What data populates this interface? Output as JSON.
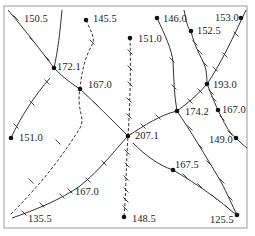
{
  "diagram": {
    "type": "topographic-network",
    "frame": {
      "x": 4,
      "y": 6,
      "w": 243,
      "h": 222,
      "stroke": "#999999"
    },
    "line_color": "#333333",
    "points": [
      {
        "id": "p150_5",
        "label": "150.5",
        "x": 10,
        "y": 12,
        "lx": 24,
        "ly": 13,
        "marker": false
      },
      {
        "id": "p145_5",
        "label": "145.5",
        "x": 86,
        "y": 20,
        "lx": 93,
        "ly": 13,
        "marker": true
      },
      {
        "id": "p146_0",
        "label": "146.0",
        "x": 157,
        "y": 18,
        "lx": 163,
        "ly": 13,
        "marker": true
      },
      {
        "id": "p153_0",
        "label": "153.0",
        "x": 241,
        "y": 18,
        "lx": 215,
        "ly": 12,
        "marker": true
      },
      {
        "id": "p151_0a",
        "label": "151.0",
        "x": 130,
        "y": 38,
        "lx": 138,
        "ly": 33,
        "marker": true
      },
      {
        "id": "p152_5",
        "label": "152.5",
        "x": 191,
        "y": 31,
        "lx": 197,
        "ly": 25,
        "marker": true
      },
      {
        "id": "p172_1",
        "label": "172.1",
        "x": 54,
        "y": 68,
        "lx": 57,
        "ly": 61,
        "marker": true
      },
      {
        "id": "p167_0a",
        "label": "167.0",
        "x": 80,
        "y": 89,
        "lx": 88,
        "ly": 79,
        "marker": true
      },
      {
        "id": "p193_0",
        "label": "193.0",
        "x": 207,
        "y": 84,
        "lx": 213,
        "ly": 79,
        "marker": true
      },
      {
        "id": "p174_2",
        "label": "174.2",
        "x": 177,
        "y": 111,
        "lx": 185,
        "ly": 106,
        "marker": true
      },
      {
        "id": "p167_0b",
        "label": "167.0",
        "x": 218,
        "y": 110,
        "lx": 222,
        "ly": 104,
        "marker": true
      },
      {
        "id": "p151_0b",
        "label": "151.0",
        "x": 11,
        "y": 138,
        "lx": 19,
        "ly": 132,
        "marker": true
      },
      {
        "id": "p207_1",
        "label": "207.1",
        "x": 128,
        "y": 136,
        "lx": 135,
        "ly": 130,
        "marker": true
      },
      {
        "id": "p149_0",
        "label": "149.0",
        "x": 236,
        "y": 138,
        "lx": 209,
        "ly": 134,
        "marker": true
      },
      {
        "id": "p167_5",
        "label": "167.5",
        "x": 173,
        "y": 170,
        "lx": 175,
        "ly": 159,
        "marker": true
      },
      {
        "id": "p167_0c",
        "label": "167.0",
        "x": 72,
        "y": 189,
        "lx": 75,
        "ly": 186,
        "marker": false
      },
      {
        "id": "p135_5",
        "label": "135.5",
        "x": 12,
        "y": 217,
        "lx": 28,
        "ly": 213,
        "marker": false
      },
      {
        "id": "p148_5",
        "label": "148.5",
        "x": 124,
        "y": 217,
        "lx": 132,
        "ly": 213,
        "marker": true
      },
      {
        "id": "p125_5",
        "label": "125.5",
        "x": 237,
        "y": 215,
        "lx": 210,
        "ly": 214,
        "marker": true
      }
    ],
    "lines": [
      {
        "name": "ridge-150-to-207",
        "style": "solid",
        "d": "M8,10 C25,30 42,52 54,68 C64,78 72,84 80,89 C95,103 112,120 128,136",
        "ticks": [
          [
            16,
            18
          ],
          [
            32,
            40
          ],
          [
            47,
            58
          ],
          [
            96,
            104
          ],
          [
            112,
            120
          ]
        ]
      },
      {
        "name": "line-172-north",
        "style": "solid",
        "d": "M54,68 C58,50 60,32 62,10",
        "ticks": []
      },
      {
        "name": "line-151-west",
        "style": "solid",
        "d": "M11,138 C20,118 35,95 50,78",
        "ticks": [
          [
            16,
            126
          ],
          [
            32,
            103
          ],
          [
            47,
            82
          ]
        ]
      },
      {
        "name": "valley-145-dashed",
        "style": "dashed",
        "d": "M86,20 C90,30 96,38 92,45 C88,52 82,65 80,89 C76,110 86,118 80,128 C60,160 40,185 10,215",
        "ticks": [
          [
            92,
            42
          ],
          [
            58,
            142
          ],
          [
            31,
            181
          ]
        ]
      },
      {
        "name": "valley-151-dashed",
        "style": "dashed",
        "d": "M130,38 C131,70 130,105 128,136 C126,165 126,195 124,217",
        "ticks": [
          [
            130,
            52
          ],
          [
            130,
            68
          ],
          [
            130,
            84
          ],
          [
            129,
            100
          ],
          [
            129,
            116
          ],
          [
            127,
            152
          ],
          [
            127,
            165
          ],
          [
            126,
            178
          ],
          [
            126,
            190
          ],
          [
            126,
            200
          ],
          [
            125,
            208
          ]
        ]
      },
      {
        "name": "ridge-207-to-153",
        "style": "solid",
        "d": "M128,136 C145,125 160,115 177,111 C192,100 200,92 207,84 C220,65 232,40 246,10",
        "ticks": [
          [
            143,
            126
          ],
          [
            158,
            117
          ],
          [
            190,
            101
          ],
          [
            200,
            91
          ],
          [
            215,
            69
          ],
          [
            225,
            55
          ],
          [
            236,
            34
          ]
        ]
      },
      {
        "name": "line-146-to-174",
        "style": "solid",
        "d": "M157,18 C165,35 172,50 173,62 C174,80 174,95 177,111",
        "ticks": [
          [
            172,
            60
          ],
          [
            174,
            87
          ]
        ]
      },
      {
        "name": "line-152-to-193",
        "style": "solid",
        "d": "M184,10 C186,20 188,30 191,31 C195,50 204,60 206,70 C207,78 207,82 207,84",
        "ticks": [
          [
            195,
            43
          ],
          [
            200,
            52
          ],
          [
            205,
            64
          ]
        ]
      },
      {
        "name": "line-193-to-149",
        "style": "solid",
        "d": "M207,84 C212,96 215,104 218,110 C224,122 228,132 236,138 C240,142 244,146 247,148",
        "ticks": [
          [
            211,
            92
          ],
          [
            214,
            99
          ],
          [
            222,
            118
          ],
          [
            230,
            133
          ]
        ]
      },
      {
        "name": "line-174-to-125",
        "style": "solid",
        "d": "M177,111 C190,130 205,155 220,180 C228,195 232,205 237,215",
        "ticks": [
          [
            190,
            128
          ],
          [
            200,
            146
          ],
          [
            209,
            163
          ],
          [
            222,
            181
          ],
          [
            230,
            198
          ]
        ]
      },
      {
        "name": "line-207-to-125",
        "style": "solid",
        "d": "M133,143 C145,155 158,165 173,170 C190,180 205,190 218,200 C226,206 232,212 237,215",
        "ticks": [
          [
            185,
            176
          ],
          [
            200,
            186
          ],
          [
            214,
            197
          ],
          [
            228,
            208
          ]
        ]
      },
      {
        "name": "line-207-to-135",
        "style": "solid",
        "d": "M128,136 C115,150 100,170 80,186 C60,200 35,210 12,218",
        "ticks": [
          [
            104,
            163
          ],
          [
            88,
            180
          ],
          [
            70,
            191
          ],
          [
            62,
            196
          ],
          [
            42,
            205
          ],
          [
            24,
            213
          ]
        ]
      }
    ]
  }
}
